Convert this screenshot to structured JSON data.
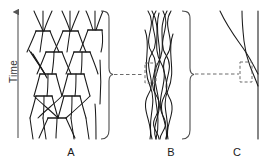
{
  "figure": {
    "kind": "scientific-diagram",
    "background_color": "#ffffff",
    "stroke_color": "#1a1a1a",
    "dashed_color": "#6b6b6b",
    "bracket_color": "#4d4d4d"
  },
  "axis": {
    "label": "Time",
    "orientation": "vertical",
    "arrow_direction": "up"
  },
  "panels": [
    {
      "id": "A",
      "label": "A",
      "description": "branching recombination network with horizontal junction bars"
    },
    {
      "id": "B",
      "label": "B",
      "description": "braid of interwoven sinuous strands"
    },
    {
      "id": "C",
      "label": "C",
      "description": "single crossing lineage beside a straight vertical line"
    }
  ],
  "connectors": [
    {
      "from": "A",
      "to": "B",
      "style": "dashed"
    },
    {
      "from": "B",
      "to": "C",
      "style": "dashed"
    }
  ],
  "highlight_boxes": [
    {
      "in_panel": "B",
      "style": "dashed"
    },
    {
      "in_panel": "C",
      "style": "dashed"
    }
  ]
}
